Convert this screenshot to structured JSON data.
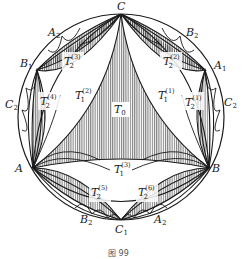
{
  "figure": {
    "caption": "图 99",
    "colors": {
      "stroke": "#1a1a1a",
      "hatch": "#1a1a1a",
      "background": "#ffffff"
    },
    "vertices": {
      "C": {
        "label": "C",
        "sub": ""
      },
      "A": {
        "label": "A",
        "sub": ""
      },
      "B": {
        "label": "B",
        "sub": ""
      },
      "A1": {
        "label": "A",
        "sub": "1"
      },
      "A2_top": {
        "label": "A",
        "sub": "2"
      },
      "A2_bottom": {
        "label": "A",
        "sub": "2"
      },
      "B1": {
        "label": "B",
        "sub": "1"
      },
      "B2_top": {
        "label": "B",
        "sub": "2"
      },
      "B2_bottom": {
        "label": "B",
        "sub": "2"
      },
      "C1": {
        "label": "C",
        "sub": "1"
      },
      "C2_left": {
        "label": "C",
        "sub": "2"
      },
      "C2_right": {
        "label": "C",
        "sub": "2"
      }
    },
    "regions": {
      "T0": {
        "label": "T",
        "sub": "0",
        "sup": ""
      },
      "T1_1": {
        "label": "T",
        "sub": "1",
        "sup": "(1)"
      },
      "T1_2": {
        "label": "T",
        "sub": "1",
        "sup": "(2)"
      },
      "T1_3": {
        "label": "T",
        "sub": "1",
        "sup": "(3)"
      },
      "T2_1": {
        "label": "T",
        "sub": "2",
        "sup": "(1)"
      },
      "T2_2": {
        "label": "T",
        "sub": "2",
        "sup": "(2)"
      },
      "T2_3": {
        "label": "T",
        "sub": "2",
        "sup": "(3)"
      },
      "T2_4": {
        "label": "T",
        "sub": "2",
        "sup": "(4)"
      },
      "T2_5": {
        "label": "T",
        "sub": "2",
        "sup": "(5)"
      },
      "T2_6": {
        "label": "T",
        "sub": "2",
        "sup": "(6)"
      }
    }
  }
}
